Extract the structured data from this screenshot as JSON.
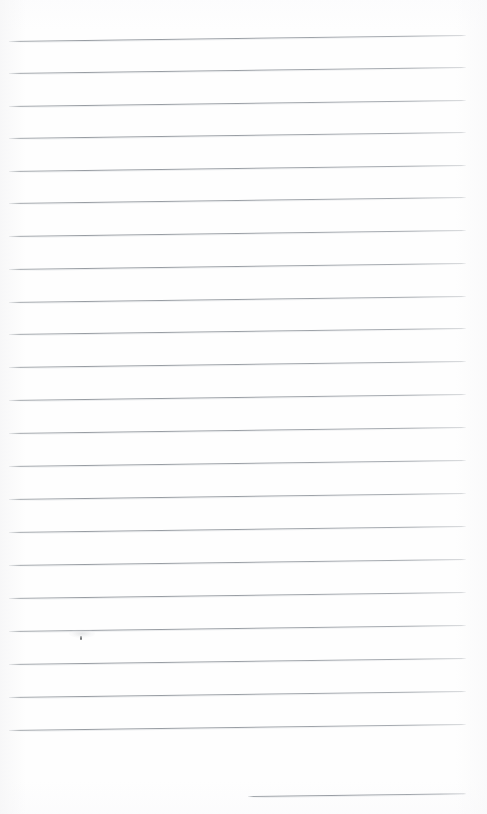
{
  "document": {
    "type": "scanned-ruled-notebook-page",
    "title": "",
    "body_text": "",
    "page_width": 487,
    "page_height": 814,
    "background_color": "#fefefe",
    "rule_color": "#9aa0a6",
    "rule_thickness": 1,
    "rule_tilt_degrees": -0.75,
    "rule_spacing": 32.5,
    "is_blank": true
  },
  "ruled_lines": [
    {
      "id": "rule-1",
      "left": 9,
      "y_left": 41,
      "length": 457
    },
    {
      "id": "rule-2",
      "left": 9,
      "y_left": 73,
      "length": 457
    },
    {
      "id": "rule-3",
      "left": 9,
      "y_left": 106,
      "length": 457
    },
    {
      "id": "rule-4",
      "left": 9,
      "y_left": 138,
      "length": 457
    },
    {
      "id": "rule-5",
      "left": 9,
      "y_left": 171,
      "length": 457
    },
    {
      "id": "rule-6",
      "left": 9,
      "y_left": 203,
      "length": 457
    },
    {
      "id": "rule-7",
      "left": 9,
      "y_left": 236,
      "length": 457
    },
    {
      "id": "rule-8",
      "left": 9,
      "y_left": 269,
      "length": 457
    },
    {
      "id": "rule-9",
      "left": 9,
      "y_left": 302,
      "length": 457
    },
    {
      "id": "rule-10",
      "left": 9,
      "y_left": 334,
      "length": 457
    },
    {
      "id": "rule-11",
      "left": 9,
      "y_left": 367,
      "length": 457
    },
    {
      "id": "rule-12",
      "left": 9,
      "y_left": 400,
      "length": 457
    },
    {
      "id": "rule-13",
      "left": 9,
      "y_left": 433,
      "length": 457
    },
    {
      "id": "rule-14",
      "left": 9,
      "y_left": 466,
      "length": 457
    },
    {
      "id": "rule-15",
      "left": 9,
      "y_left": 499,
      "length": 457
    },
    {
      "id": "rule-16",
      "left": 9,
      "y_left": 532,
      "length": 457
    },
    {
      "id": "rule-17",
      "left": 9,
      "y_left": 565,
      "length": 457
    },
    {
      "id": "rule-18",
      "left": 9,
      "y_left": 598,
      "length": 457
    },
    {
      "id": "rule-19",
      "left": 9,
      "y_left": 631,
      "length": 457
    },
    {
      "id": "rule-20",
      "left": 9,
      "y_left": 664,
      "length": 457
    },
    {
      "id": "rule-21",
      "left": 9,
      "y_left": 697,
      "length": 457
    },
    {
      "id": "rule-22",
      "left": 9,
      "y_left": 730,
      "length": 457
    },
    {
      "id": "rule-23",
      "left": 248,
      "y_left": 796,
      "length": 218
    }
  ],
  "marks": [
    {
      "id": "ink-speck",
      "x": 80,
      "y": 636
    },
    {
      "id": "ink-smudge",
      "x": 69,
      "y": 629
    }
  ]
}
